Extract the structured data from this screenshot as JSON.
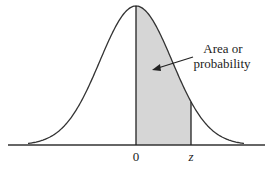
{
  "diagram": {
    "title": "",
    "type": "standard normal curve with shaded area",
    "annotation": {
      "line1": "Area or",
      "line2": "probability"
    },
    "axis_labels": {
      "zero": "0",
      "z": "z"
    },
    "colors": {
      "curve": "#333333",
      "shade": "#d6d6d6",
      "axis": "#333333"
    }
  }
}
